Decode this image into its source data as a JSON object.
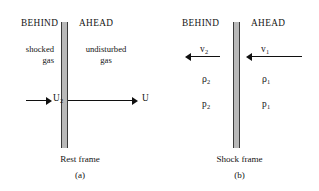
{
  "figure": {
    "panels": [
      {
        "id": "a",
        "letter": "(a)",
        "frame_caption": "Rest frame",
        "headings": {
          "behind": "BEHIND",
          "ahead": "AHEAD"
        },
        "regions": {
          "behind_line1": "shocked",
          "behind_line2": "gas",
          "ahead_line1": "undisturbed",
          "ahead_line2": "gas"
        },
        "arrows": [
          {
            "name": "u2",
            "label_base": "U",
            "label_sub": "2",
            "direction": "right"
          },
          {
            "name": "u",
            "label_base": "U",
            "label_sub": "",
            "direction": "right"
          }
        ]
      },
      {
        "id": "b",
        "letter": "(b)",
        "frame_caption": "Shock frame",
        "headings": {
          "behind": "BEHIND",
          "ahead": "AHEAD"
        },
        "arrows": [
          {
            "name": "v2",
            "label_base": "v",
            "label_sub": "2",
            "direction": "left"
          },
          {
            "name": "v1",
            "label_base": "v",
            "label_sub": "1",
            "direction": "left"
          }
        ],
        "quantities": {
          "density_behind_base": "ρ",
          "density_behind_sub": "2",
          "density_ahead_base": "ρ",
          "density_ahead_sub": "1",
          "pressure_behind_base": "p",
          "pressure_behind_sub": "2",
          "pressure_ahead_base": "p",
          "pressure_ahead_sub": "1"
        }
      }
    ]
  },
  "colors": {
    "ink": "#141414",
    "shock_fill": "#b9b9b9",
    "shock_edge": "#3a3a3a",
    "background": "#ffffff"
  }
}
